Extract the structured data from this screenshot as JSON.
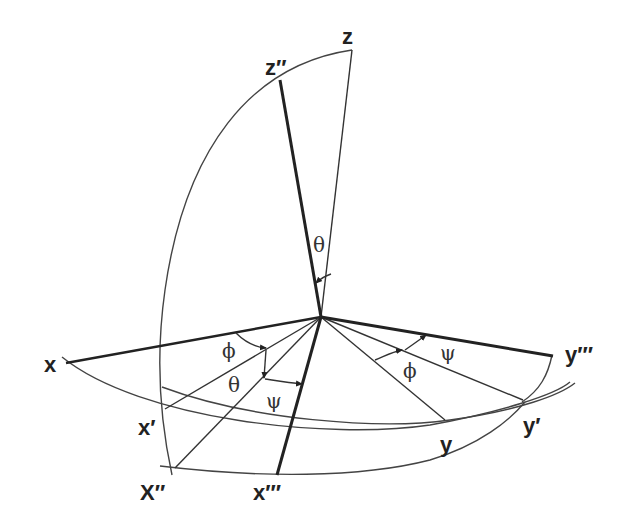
{
  "diagram": {
    "axis_labels": {
      "z": "z",
      "z2": "z′′",
      "x": "x",
      "x1": "x′",
      "x2": "X′′",
      "x3": "x′′′",
      "y": "y",
      "y1": "y′",
      "y3": "y′′′"
    },
    "angle_labels": {
      "theta_top": "θ",
      "phi_left": "ϕ",
      "theta_left": "θ",
      "psi_left": "ψ",
      "phi_right": "ϕ",
      "psi_right": "ψ"
    },
    "colors": {
      "line": "#222222",
      "background": "#ffffff"
    }
  }
}
